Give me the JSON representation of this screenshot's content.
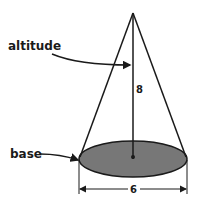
{
  "diagram": {
    "shape": "cone",
    "labels": {
      "altitude": "altitude",
      "base": "base"
    },
    "dimensions": {
      "height": "8",
      "diameter": "6"
    },
    "colors": {
      "stroke": "#1a1a1a",
      "base_fill": "#777777",
      "background": "#ffffff"
    }
  }
}
